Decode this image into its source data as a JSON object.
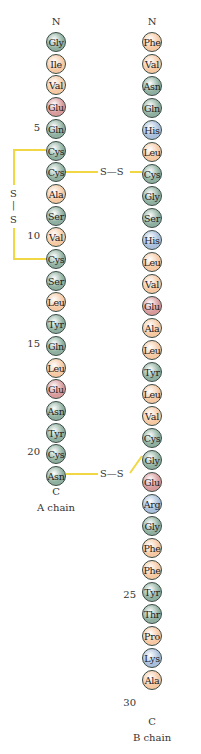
{
  "colors": {
    "green": "#8fb0a0",
    "orange": "#f6c9a3",
    "red": "#d99a9c",
    "blue": "#a9bfdc",
    "bond": "#f2d744"
  },
  "a_chain": {
    "label": "A chain",
    "n_term": "N",
    "c_term": "C",
    "residues": [
      {
        "n": 1,
        "aa": "Gly",
        "c": "green"
      },
      {
        "n": 2,
        "aa": "Ile",
        "c": "orange"
      },
      {
        "n": 3,
        "aa": "Val",
        "c": "orange"
      },
      {
        "n": 4,
        "aa": "Glu",
        "c": "red"
      },
      {
        "n": 5,
        "aa": "Gln",
        "c": "green"
      },
      {
        "n": 6,
        "aa": "Cys",
        "c": "green"
      },
      {
        "n": 7,
        "aa": "Cys",
        "c": "green"
      },
      {
        "n": 8,
        "aa": "Ala",
        "c": "orange"
      },
      {
        "n": 9,
        "aa": "Ser",
        "c": "green"
      },
      {
        "n": 10,
        "aa": "Val",
        "c": "orange"
      },
      {
        "n": 11,
        "aa": "Cys",
        "c": "green"
      },
      {
        "n": 12,
        "aa": "Ser",
        "c": "green"
      },
      {
        "n": 13,
        "aa": "Leu",
        "c": "orange"
      },
      {
        "n": 14,
        "aa": "Tyr",
        "c": "green"
      },
      {
        "n": 15,
        "aa": "Gln",
        "c": "green"
      },
      {
        "n": 16,
        "aa": "Leu",
        "c": "orange"
      },
      {
        "n": 17,
        "aa": "Glu",
        "c": "red"
      },
      {
        "n": 18,
        "aa": "Asn",
        "c": "green"
      },
      {
        "n": 19,
        "aa": "Tyr",
        "c": "green"
      },
      {
        "n": 20,
        "aa": "Cys",
        "c": "green"
      },
      {
        "n": 21,
        "aa": "Asn",
        "c": "green"
      }
    ],
    "numbers": [
      "5",
      "10",
      "15",
      "20"
    ]
  },
  "b_chain": {
    "label": "B chain",
    "n_term": "N",
    "c_term": "C",
    "residues": [
      {
        "n": 1,
        "aa": "Phe",
        "c": "orange"
      },
      {
        "n": 2,
        "aa": "Val",
        "c": "orange"
      },
      {
        "n": 3,
        "aa": "Asn",
        "c": "green"
      },
      {
        "n": 4,
        "aa": "Gln",
        "c": "green"
      },
      {
        "n": 5,
        "aa": "His",
        "c": "blue"
      },
      {
        "n": 6,
        "aa": "Leu",
        "c": "orange"
      },
      {
        "n": 7,
        "aa": "Cys",
        "c": "green"
      },
      {
        "n": 8,
        "aa": "Gly",
        "c": "green"
      },
      {
        "n": 9,
        "aa": "Ser",
        "c": "green"
      },
      {
        "n": 10,
        "aa": "His",
        "c": "blue"
      },
      {
        "n": 11,
        "aa": "Leu",
        "c": "orange"
      },
      {
        "n": 12,
        "aa": "Val",
        "c": "orange"
      },
      {
        "n": 13,
        "aa": "Glu",
        "c": "red"
      },
      {
        "n": 14,
        "aa": "Ala",
        "c": "orange"
      },
      {
        "n": 15,
        "aa": "Leu",
        "c": "orange"
      },
      {
        "n": 16,
        "aa": "Tyr",
        "c": "green"
      },
      {
        "n": 17,
        "aa": "Leu",
        "c": "orange"
      },
      {
        "n": 18,
        "aa": "Val",
        "c": "orange"
      },
      {
        "n": 19,
        "aa": "Cys",
        "c": "green"
      },
      {
        "n": 20,
        "aa": "Gly",
        "c": "green"
      },
      {
        "n": 21,
        "aa": "Glu",
        "c": "red"
      },
      {
        "n": 22,
        "aa": "Arg",
        "c": "blue"
      },
      {
        "n": 23,
        "aa": "Gly",
        "c": "green"
      },
      {
        "n": 24,
        "aa": "Phe",
        "c": "orange"
      },
      {
        "n": 25,
        "aa": "Phe",
        "c": "orange"
      },
      {
        "n": 26,
        "aa": "Tyr",
        "c": "green"
      },
      {
        "n": 27,
        "aa": "Thr",
        "c": "green"
      },
      {
        "n": 28,
        "aa": "Pro",
        "c": "orange"
      },
      {
        "n": 29,
        "aa": "Lys",
        "c": "blue"
      },
      {
        "n": 30,
        "aa": "Ala",
        "c": "orange"
      }
    ],
    "numbers": [
      "25",
      "30"
    ]
  },
  "disulfides": {
    "intra_a": {
      "top": "S",
      "sep": "|",
      "bottom": "S"
    },
    "a7_b7": "S—S",
    "a20_b19": "S—S"
  }
}
